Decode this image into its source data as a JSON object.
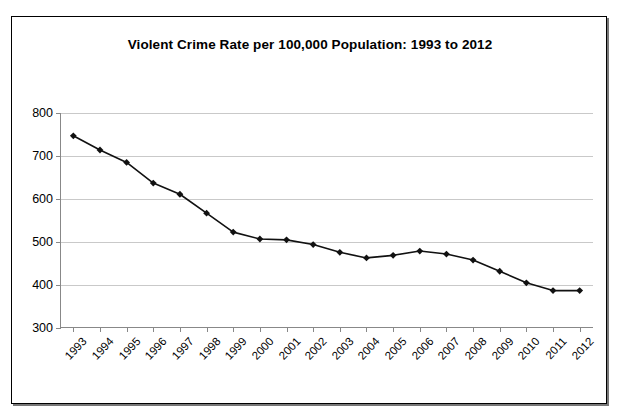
{
  "chart_data": {
    "type": "line",
    "title": "Violent Crime Rate per 100,000 Population: 1993 to 2012",
    "xlabel": "",
    "ylabel": "",
    "categories": [
      "1993",
      "1994",
      "1995",
      "1996",
      "1997",
      "1998",
      "1999",
      "2000",
      "2001",
      "2002",
      "2003",
      "2004",
      "2005",
      "2006",
      "2007",
      "2008",
      "2009",
      "2010",
      "2011",
      "2012"
    ],
    "values": [
      747,
      714,
      685,
      637,
      611,
      567,
      523,
      507,
      505,
      494,
      476,
      463,
      469,
      479,
      472,
      458,
      432,
      405,
      387,
      387
    ],
    "ylim": [
      300,
      800
    ],
    "yticks": [
      300,
      400,
      500,
      600,
      700,
      800
    ],
    "ytick_labels": [
      "300",
      "400",
      "500",
      "600",
      "700",
      "800"
    ],
    "grid": true,
    "legend": false,
    "marker": "diamond",
    "line_color": "#111111",
    "grid_color": "#c9c9c9",
    "axis_color": "#888888",
    "background": "#ffffff"
  }
}
